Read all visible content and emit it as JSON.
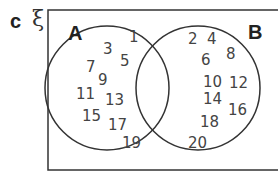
{
  "question_part": "c",
  "universal_symbol": "ξ",
  "sets": {
    "A": {
      "label": "A",
      "only": [
        "1",
        "3",
        "5",
        "7",
        "9",
        "11",
        "13",
        "15",
        "17",
        "19"
      ]
    },
    "B": {
      "label": "B",
      "only": [
        "2",
        "4",
        "6",
        "8",
        "10",
        "12",
        "14",
        "16",
        "18",
        "20"
      ]
    },
    "intersection": []
  },
  "colors": {
    "stroke": "#333333",
    "text": "#444444",
    "background": "#ffffff"
  }
}
